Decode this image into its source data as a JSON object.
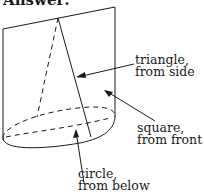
{
  "heading": "Answer:",
  "labels": {
    "triangle": {
      "line1": "triangle,",
      "line2": "from side"
    },
    "square": {
      "line1": "square,",
      "line2": "from front"
    },
    "circle": {
      "line1": "circle,",
      "line2": "from below"
    }
  },
  "colors": {
    "ink": "#1a1a1a",
    "background": "#ffffff"
  }
}
